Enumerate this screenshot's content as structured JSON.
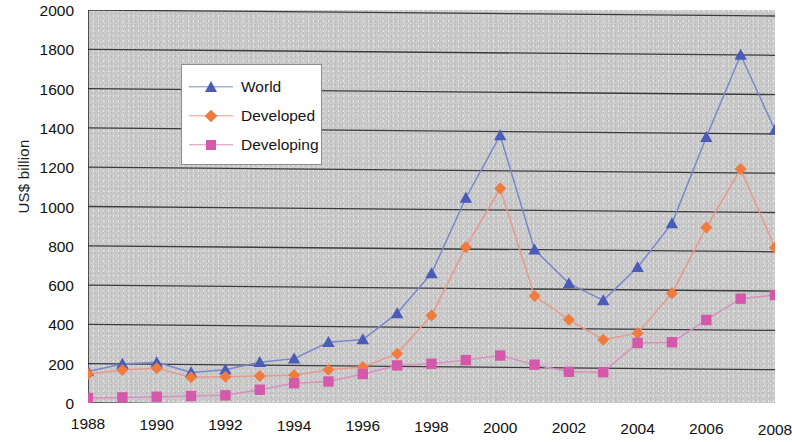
{
  "chart_data": {
    "type": "line",
    "title": "",
    "xlabel": "",
    "ylabel": "US$ billion",
    "xlim": [
      1988,
      2008
    ],
    "ylim": [
      0,
      2000
    ],
    "ytick_step": 200,
    "xtick_step": 2,
    "grid": "horizontal",
    "legend_position": "upper-left-inside",
    "plot_background": "#c9c9c9",
    "x": [
      1988,
      1989,
      1990,
      1991,
      1992,
      1993,
      1994,
      1995,
      1996,
      1997,
      1998,
      1999,
      2000,
      2001,
      2002,
      2003,
      2004,
      2005,
      2006,
      2007,
      2008
    ],
    "yticks": [
      0,
      200,
      400,
      600,
      800,
      1000,
      1200,
      1400,
      1600,
      1800,
      2000
    ],
    "xticks": [
      1988,
      1990,
      1992,
      1994,
      1996,
      1998,
      2000,
      2002,
      2004,
      2006,
      2008
    ],
    "series": [
      {
        "name": "World",
        "color": "#4a5bb8",
        "line_color": "#7b87cc",
        "marker": "triangle",
        "values": [
          160,
          200,
          210,
          160,
          175,
          215,
          235,
          320,
          335,
          470,
          675,
          1060,
          1380,
          800,
          630,
          545,
          715,
          940,
          1380,
          1800,
          1420
        ]
      },
      {
        "name": "Developed",
        "color": "#ef7b3e",
        "line_color": "#e79a8c",
        "marker": "diamond",
        "values": [
          148,
          170,
          180,
          135,
          140,
          145,
          150,
          180,
          195,
          265,
          460,
          810,
          1110,
          565,
          445,
          345,
          380,
          585,
          920,
          1220,
          820
        ]
      },
      {
        "name": "Developing",
        "color": "#d559ab",
        "line_color": "#d98fc0",
        "marker": "square",
        "values": [
          25,
          30,
          35,
          40,
          45,
          75,
          110,
          120,
          160,
          205,
          215,
          235,
          260,
          215,
          180,
          180,
          330,
          335,
          450,
          560,
          580
        ]
      }
    ]
  },
  "axes": {
    "y_title": "US$ billion",
    "y_tick_labels": [
      "0",
      "200",
      "400",
      "600",
      "800",
      "1000",
      "1200",
      "1400",
      "1600",
      "1800",
      "2000"
    ],
    "x_tick_labels": [
      "1988",
      "1990",
      "1992",
      "1994",
      "1996",
      "1998",
      "2000",
      "2002",
      "2004",
      "2006",
      "2008"
    ]
  },
  "legend": {
    "entries": [
      {
        "label": "World",
        "marker": "triangle-marker",
        "color": "#4a5bb8",
        "line_color": "#7b87cc"
      },
      {
        "label": "Developed",
        "marker": "diamond-marker",
        "color": "#ef7b3e",
        "line_color": "#e79a8c"
      },
      {
        "label": "Developing",
        "marker": "square-marker",
        "color": "#d559ab",
        "line_color": "#d98fc0"
      }
    ]
  }
}
